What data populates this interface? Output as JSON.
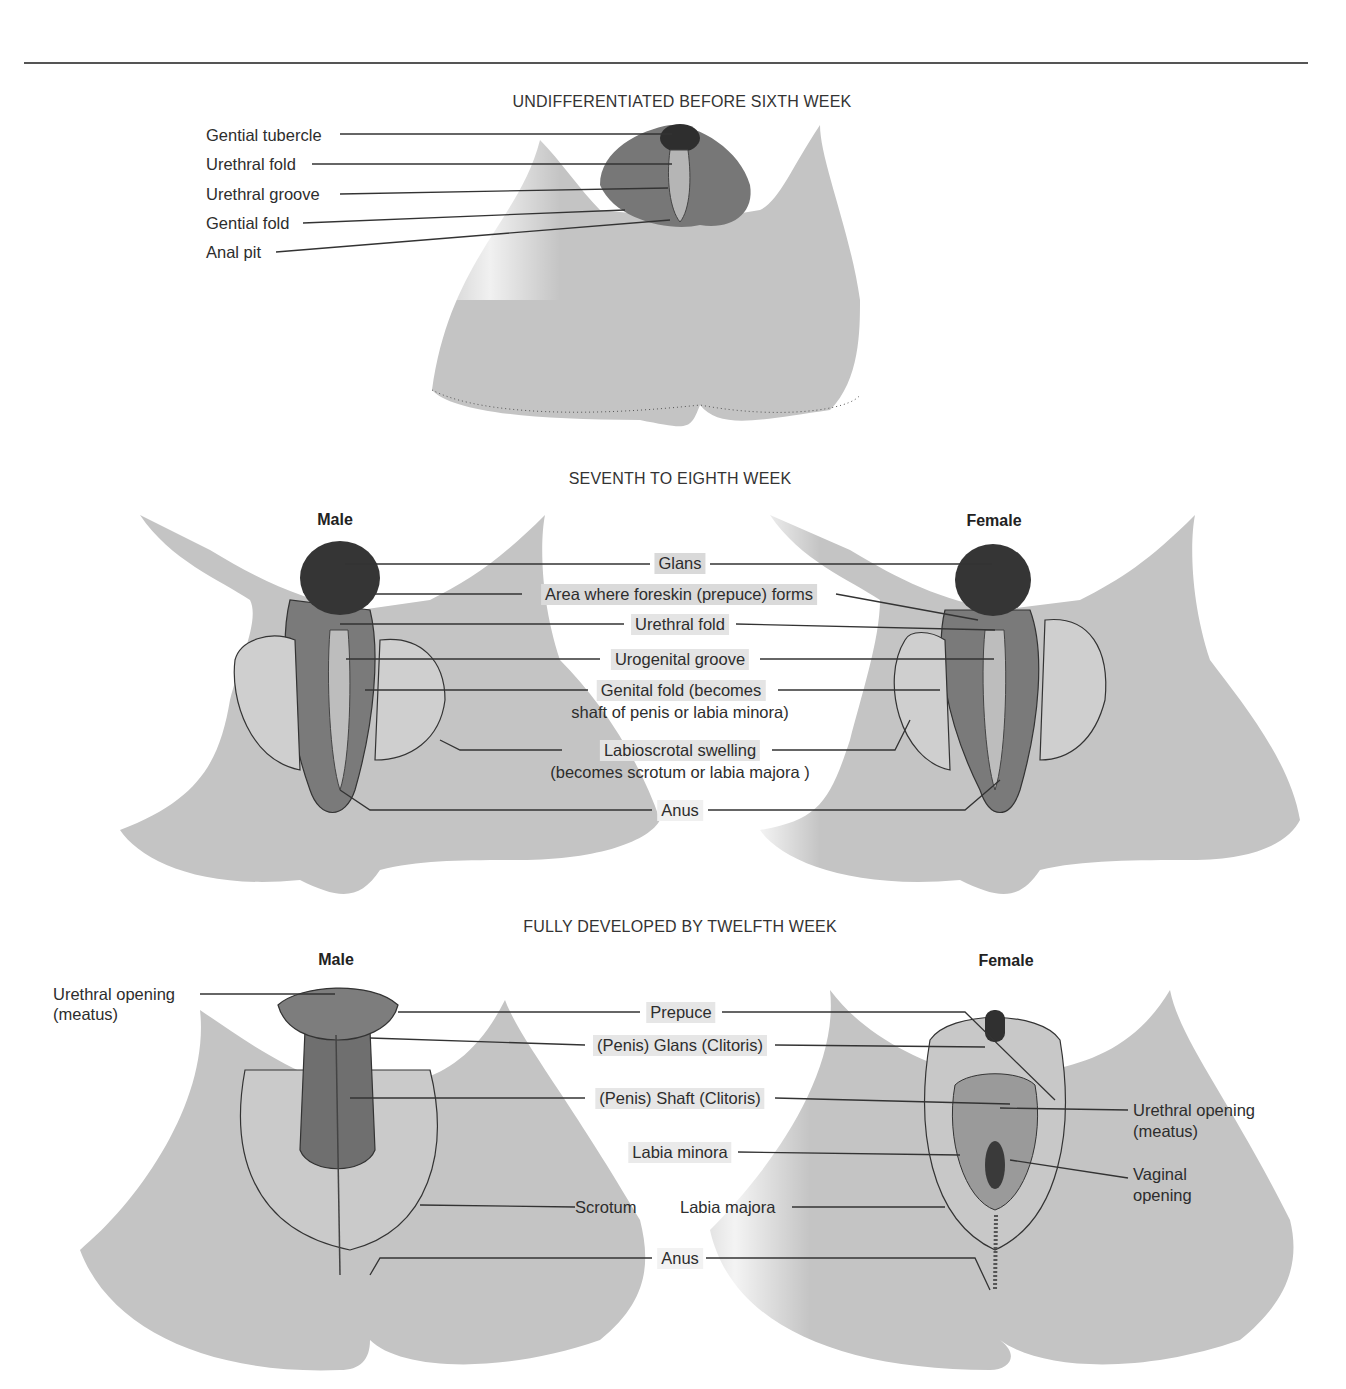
{
  "figure": {
    "panels": [
      {
        "id": "undifferentiated",
        "heading": "UNDIFFERENTIATED BEFORE SIXTH WEEK",
        "labels": [
          "Gential tubercle",
          "Urethral fold",
          "Urethral groove",
          "Gential fold",
          "Anal pit"
        ]
      },
      {
        "id": "seventh-eighth",
        "heading": "SEVENTH TO EIGHTH WEEK",
        "male_label": "Male",
        "female_label": "Female",
        "labels": [
          "Glans",
          "Area where foreskin (prepuce) forms",
          "Urethral fold",
          "Urogenital groove",
          "Genital fold (becomes",
          "shaft of penis or labia minora)",
          "Labioscrotal swelling",
          "(becomes scrotum or labia majora )",
          "Anus"
        ]
      },
      {
        "id": "twelfth",
        "heading": "FULLY DEVELOPED BY TWELFTH WEEK",
        "male_label": "Male",
        "female_label": "Female",
        "labels": {
          "urethral_opening_left_1": "Urethral opening",
          "urethral_opening_left_2": "(meatus)",
          "prepuce": "Prepuce",
          "glans": "(Penis) Glans (Clitoris)",
          "shaft": "(Penis) Shaft (Clitoris)",
          "labia_minora": "Labia minora",
          "scrotum": "Scrotum",
          "labia_majora": "Labia majora",
          "anus": "Anus",
          "urethral_opening_right_1": "Urethral opening",
          "urethral_opening_right_2": "(meatus)",
          "vaginal_opening_1": "Vaginal",
          "vaginal_opening_2": "opening"
        }
      }
    ],
    "colors": {
      "skin": "#c4c4c4",
      "dark": "#3a3a3a",
      "mid": "#7a7a7a",
      "line": "#333333"
    }
  }
}
